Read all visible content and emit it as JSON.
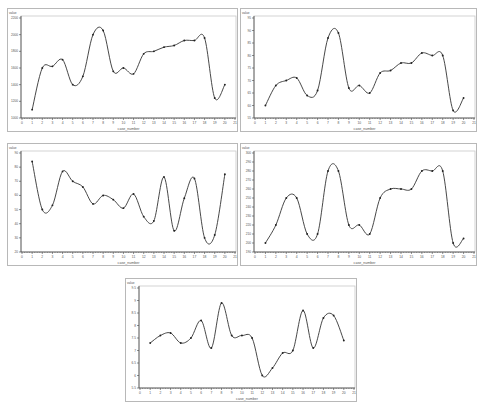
{
  "chart_data": [
    {
      "type": "line",
      "title": "",
      "ytitle": "value",
      "xlabel": "case_number",
      "x": [
        1,
        2,
        3,
        4,
        5,
        6,
        7,
        8,
        9,
        10,
        11,
        12,
        13,
        14,
        15,
        16,
        17,
        18,
        19,
        20
      ],
      "values": [
        1100,
        1600,
        1620,
        1700,
        1400,
        1500,
        2000,
        2050,
        1560,
        1600,
        1530,
        1770,
        1800,
        1850,
        1870,
        1930,
        1930,
        1960,
        1240,
        1400
      ],
      "ylim": [
        1000,
        2200
      ],
      "yticks": [
        1000,
        1200,
        1400,
        1600,
        1800,
        2000,
        2200
      ],
      "xlim": [
        0,
        21
      ],
      "grid": false
    },
    {
      "type": "line",
      "title": "",
      "ytitle": "value",
      "xlabel": "case_number",
      "x": [
        1,
        2,
        3,
        4,
        5,
        6,
        7,
        8,
        9,
        10,
        11,
        12,
        13,
        14,
        15,
        16,
        17,
        18,
        19,
        20
      ],
      "values": [
        60,
        68,
        70,
        71,
        64,
        66,
        87,
        89,
        67,
        68,
        65,
        73,
        74,
        77,
        77,
        81,
        80,
        80,
        58,
        63
      ],
      "ylim": [
        55,
        95
      ],
      "yticks": [
        55,
        60,
        65,
        70,
        75,
        80,
        85,
        90,
        95
      ],
      "xlim": [
        0,
        21
      ],
      "grid": false
    },
    {
      "type": "line",
      "title": "",
      "ytitle": "value",
      "xlabel": "case_number",
      "x": [
        1,
        2,
        3,
        4,
        5,
        6,
        7,
        8,
        9,
        10,
        11,
        12,
        13,
        14,
        15,
        16,
        17,
        18,
        19,
        20
      ],
      "values": [
        84,
        50,
        53,
        77,
        70,
        66,
        54,
        60,
        57,
        51,
        61,
        45,
        42,
        73,
        35,
        58,
        72,
        30,
        32,
        75
      ],
      "ylim": [
        20,
        90
      ],
      "yticks": [
        20,
        30,
        40,
        50,
        60,
        70,
        80,
        90
      ],
      "xlim": [
        0,
        21
      ],
      "grid": false
    },
    {
      "type": "line",
      "title": "",
      "ytitle": "value",
      "xlabel": "case_number",
      "x": [
        1,
        2,
        3,
        4,
        5,
        6,
        7,
        8,
        9,
        10,
        11,
        12,
        13,
        14,
        15,
        16,
        17,
        18,
        19,
        20
      ],
      "values": [
        200,
        220,
        250,
        250,
        210,
        210,
        280,
        280,
        220,
        220,
        210,
        250,
        260,
        260,
        260,
        280,
        280,
        280,
        200,
        205
      ],
      "ylim": [
        190,
        300
      ],
      "yticks": [
        190,
        200,
        210,
        220,
        230,
        240,
        250,
        260,
        270,
        280,
        290,
        300
      ],
      "xlim": [
        0,
        21
      ],
      "grid": false
    },
    {
      "type": "line",
      "title": "",
      "ytitle": "value",
      "xlabel": "case_number",
      "x": [
        1,
        2,
        3,
        4,
        5,
        6,
        7,
        8,
        9,
        10,
        11,
        12,
        13,
        14,
        15,
        16,
        17,
        18,
        19,
        20
      ],
      "values": [
        7.3,
        7.6,
        7.7,
        7.3,
        7.5,
        8.2,
        7.1,
        8.9,
        7.6,
        7.6,
        7.5,
        6.0,
        6.3,
        6.9,
        7.0,
        8.6,
        7.1,
        8.3,
        8.4,
        7.4
      ],
      "ylim": [
        5.5,
        9.5
      ],
      "yticks": [
        5.5,
        6.0,
        6.5,
        7.0,
        7.5,
        8.0,
        8.5,
        9.0,
        9.5
      ],
      "xlim": [
        0,
        21
      ],
      "grid": false
    }
  ],
  "layout": {
    "panels": [
      {
        "left": 7,
        "top": 8,
        "width": 231,
        "height": 124
      },
      {
        "left": 240,
        "top": 8,
        "width": 237,
        "height": 124
      },
      {
        "left": 7,
        "top": 143,
        "width": 231,
        "height": 123
      },
      {
        "left": 240,
        "top": 143,
        "width": 237,
        "height": 123
      },
      {
        "left": 125,
        "top": 278,
        "width": 232,
        "height": 124
      }
    ]
  },
  "style": {
    "line_color": "#333333",
    "marker_color": "#222222",
    "axis_color": "#444444",
    "frame_color": "#b8b8b8"
  }
}
